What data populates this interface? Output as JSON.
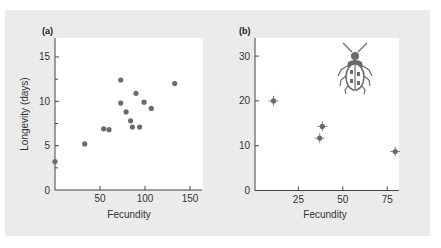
{
  "chart_data": [
    {
      "type": "scatter",
      "panel_label": "(a)",
      "title": "",
      "xlabel": "Fecundity",
      "ylabel": "Longevity (days)",
      "xlim": [
        0,
        160
      ],
      "ylim": [
        0,
        17
      ],
      "xticks": [
        50,
        100,
        150
      ],
      "yticks": [
        0,
        5,
        10,
        15
      ],
      "minor_yticks": [
        2.5,
        7.5,
        12.5
      ],
      "grid": false,
      "points": [
        {
          "x": 0,
          "y": 3.2
        },
        {
          "x": 33,
          "y": 5.2
        },
        {
          "x": 54,
          "y": 6.9
        },
        {
          "x": 60,
          "y": 6.8
        },
        {
          "x": 73,
          "y": 12.4
        },
        {
          "x": 73,
          "y": 9.8
        },
        {
          "x": 79,
          "y": 8.8
        },
        {
          "x": 84,
          "y": 7.8
        },
        {
          "x": 86,
          "y": 7.1
        },
        {
          "x": 90,
          "y": 10.9
        },
        {
          "x": 94,
          "y": 7.1
        },
        {
          "x": 99,
          "y": 9.9
        },
        {
          "x": 107,
          "y": 9.2
        },
        {
          "x": 133,
          "y": 12.0
        }
      ]
    },
    {
      "type": "scatter",
      "panel_label": "(b)",
      "title": "",
      "xlabel": "Fecundity",
      "ylabel": "",
      "xlim": [
        0,
        82
      ],
      "ylim": [
        0,
        33
      ],
      "xticks": [
        25,
        50,
        75
      ],
      "yticks": [
        0,
        10,
        20,
        30
      ],
      "grid": false,
      "error_bars": true,
      "annotation": "beetle illustration",
      "points": [
        {
          "x": 11,
          "y": 20.0
        },
        {
          "x": 38.5,
          "y": 14.3
        },
        {
          "x": 37,
          "y": 11.7
        },
        {
          "x": 79.5,
          "y": 8.7
        }
      ]
    }
  ],
  "colors": {
    "background": "#ebebeb",
    "plot_area": "#ffffff",
    "point": "#6b6b6b",
    "axis": "#444444"
  },
  "icons": {
    "beetle": "beetle-icon"
  }
}
